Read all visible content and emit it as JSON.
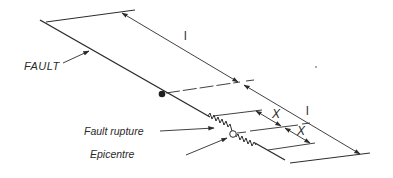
{
  "diagram": {
    "type": "fault-geometry-schematic",
    "colors": {
      "ink": "#2b2b2b",
      "background": "#ffffff"
    },
    "labels": {
      "fault": "FAULT",
      "fault_rupture": "Fault rupture",
      "epicentre": "Epicentre",
      "length_top": "l",
      "length_bottom": "l",
      "x_upper": "X",
      "x_lower": "X"
    },
    "elements": {
      "fault_line": "diagonal fault trace",
      "hypocentre_marker": "filled dot on fault",
      "epicentre_marker": "open circle on fault",
      "rupture_segment": "zigzag line along fault around epicentre"
    }
  }
}
